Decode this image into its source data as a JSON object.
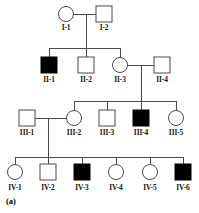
{
  "figure": {
    "panel_label": "(a)",
    "type": "pedigree-chart",
    "stroke_color": "#4a4a4a",
    "fill_affected": "#000000",
    "fill_unaffected": "#ffffff",
    "background": "#ffffff"
  },
  "chart_data": {
    "type": "pedigree",
    "title": "",
    "generations": [
      "I",
      "II",
      "III",
      "IV"
    ],
    "legend": {
      "filled": "affected",
      "open": "unaffected",
      "square": "male",
      "circle": "female"
    },
    "individuals": [
      {
        "id": "I-1",
        "label": "I-1",
        "sex": "female",
        "shape": "circle",
        "affected": false,
        "x": 66,
        "y": 14,
        "label_x": 66,
        "label_y": 24
      },
      {
        "id": "I-2",
        "label": "I-2",
        "sex": "male",
        "shape": "square",
        "affected": false,
        "x": 104,
        "y": 14,
        "label_x": 104,
        "label_y": 24
      },
      {
        "id": "II-1",
        "label": "II-1",
        "sex": "male",
        "shape": "square",
        "affected": true,
        "x": 49,
        "y": 65,
        "label_x": 49,
        "label_y": 76
      },
      {
        "id": "II-2",
        "label": "II-2",
        "sex": "male",
        "shape": "square",
        "affected": false,
        "x": 86,
        "y": 65,
        "label_x": 86,
        "label_y": 76
      },
      {
        "id": "II-3",
        "label": "II-3",
        "sex": "female",
        "shape": "circle",
        "affected": false,
        "x": 120,
        "y": 65,
        "label_x": 120,
        "label_y": 76
      },
      {
        "id": "II-4",
        "label": "II-4",
        "sex": "male",
        "shape": "square",
        "affected": false,
        "x": 162,
        "y": 65,
        "label_x": 162,
        "label_y": 76
      },
      {
        "id": "III-1",
        "label": "III-1",
        "sex": "male",
        "shape": "square",
        "affected": false,
        "x": 27,
        "y": 118,
        "label_x": 27,
        "label_y": 129
      },
      {
        "id": "III-2",
        "label": "III-2",
        "sex": "female",
        "shape": "circle",
        "affected": false,
        "x": 74,
        "y": 118,
        "label_x": 74,
        "label_y": 129
      },
      {
        "id": "III-3",
        "label": "III-3",
        "sex": "male",
        "shape": "square",
        "affected": false,
        "x": 107,
        "y": 118,
        "label_x": 107,
        "label_y": 129
      },
      {
        "id": "III-4",
        "label": "III-4",
        "sex": "male",
        "shape": "square",
        "affected": true,
        "x": 141,
        "y": 118,
        "label_x": 141,
        "label_y": 129
      },
      {
        "id": "III-5",
        "label": "III-5",
        "sex": "female",
        "shape": "circle",
        "affected": false,
        "x": 176,
        "y": 118,
        "label_x": 176,
        "label_y": 129
      },
      {
        "id": "IV-1",
        "label": "IV-1",
        "sex": "female",
        "shape": "circle",
        "affected": false,
        "x": 15,
        "y": 172,
        "label_x": 15,
        "label_y": 184
      },
      {
        "id": "IV-2",
        "label": "IV-2",
        "sex": "male",
        "shape": "square",
        "affected": false,
        "x": 48,
        "y": 172,
        "label_x": 48,
        "label_y": 184
      },
      {
        "id": "IV-3",
        "label": "IV-3",
        "sex": "male",
        "shape": "square",
        "affected": true,
        "x": 82,
        "y": 172,
        "label_x": 82,
        "label_y": 184
      },
      {
        "id": "IV-4",
        "label": "IV-4",
        "sex": "female",
        "shape": "circle",
        "affected": false,
        "x": 116,
        "y": 172,
        "label_x": 116,
        "label_y": 184
      },
      {
        "id": "IV-5",
        "label": "IV-5",
        "sex": "female",
        "shape": "circle",
        "affected": false,
        "x": 150,
        "y": 172,
        "label_x": 150,
        "label_y": 184
      },
      {
        "id": "IV-6",
        "label": "IV-6",
        "sex": "male",
        "shape": "square",
        "affected": true,
        "x": 183,
        "y": 172,
        "label_x": 183,
        "label_y": 184
      }
    ],
    "matings": [
      {
        "id": "mating-I",
        "partners": [
          "I-1",
          "I-2"
        ],
        "line_y": 14,
        "x1": 74,
        "x2": 96,
        "drop_x": 86,
        "drop_to_y": 48
      },
      {
        "id": "mating-II",
        "partners": [
          "II-3",
          "II-4"
        ],
        "line_y": 65,
        "x1": 127,
        "x2": 154,
        "drop_x": 141,
        "drop_to_y": 101
      },
      {
        "id": "mating-III",
        "partners": [
          "III-1",
          "III-2"
        ],
        "line_y": 118,
        "x1": 35,
        "x2": 67,
        "drop_x": 48,
        "drop_to_y": 157
      }
    ],
    "sibships": [
      {
        "id": "sibship-II",
        "line_y": 48,
        "x1": 49,
        "x2": 120,
        "children_x": [
          49,
          86,
          120
        ],
        "child_top_y": 57
      },
      {
        "id": "sibship-III",
        "line_y": 101,
        "x1": 74,
        "x2": 176,
        "children_x": [
          74,
          107,
          141,
          176
        ],
        "child_top_y": 110
      },
      {
        "id": "sibship-IV",
        "line_y": 157,
        "x1": 15,
        "x2": 183,
        "children_x": [
          15,
          48,
          82,
          116,
          150,
          183
        ],
        "child_top_y": 164
      }
    ],
    "symbol_size": 16,
    "circle_radius": 7.5
  }
}
